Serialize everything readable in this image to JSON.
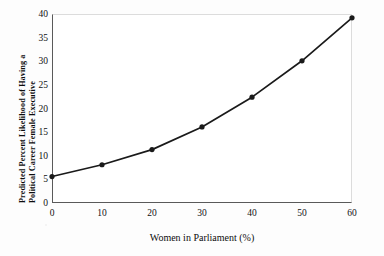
{
  "figure": {
    "name": "predicted-likelihood-line-chart",
    "background_color": "#fdfdfd",
    "plot_background_color": "#ffffff",
    "axis_color": "#5a5a5a",
    "grid_color": "#e6e6e6",
    "series_color": "#1a1a1a"
  },
  "axes": {
    "y_title_line1": "Predicted Percent Likelihood of Having a",
    "y_title_line2": "Political Career Female Executive",
    "x_title": "Women in Parliament (%)",
    "y_ticks": [
      "5",
      "10",
      "15",
      "20",
      "25",
      "30",
      "35",
      "40"
    ],
    "x_ticks": [
      "0",
      "10",
      "20",
      "30",
      "40",
      "50",
      "60"
    ],
    "origin_label": "0"
  },
  "chart_data": {
    "type": "line",
    "title": "",
    "subtitle": "",
    "xlabel": "Women in Parliament (%)",
    "ylabel": "Predicted Percent Likelihood of Having a Political Career Female Executive",
    "x": [
      0,
      10,
      20,
      30,
      40,
      50,
      60
    ],
    "values": [
      5.6,
      8.1,
      11.3,
      16.1,
      22.4,
      30.1,
      39.2
    ],
    "series": [
      {
        "name": "Predicted percent likelihood",
        "x": [
          0,
          10,
          20,
          30,
          40,
          50,
          60
        ],
        "values": [
          5.6,
          8.1,
          11.3,
          16.1,
          22.4,
          30.1,
          39.2
        ]
      }
    ],
    "xlim": [
      0,
      60
    ],
    "ylim": [
      0,
      40
    ],
    "xticks": [
      0,
      10,
      20,
      30,
      40,
      50,
      60
    ],
    "yticks": [
      5,
      10,
      15,
      20,
      25,
      30,
      35,
      40
    ],
    "grid": "horizontal",
    "legend": "none",
    "markers": "filled-circle",
    "annotations": []
  }
}
